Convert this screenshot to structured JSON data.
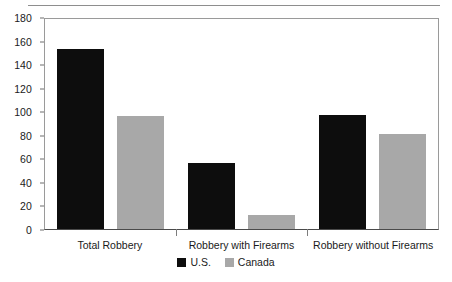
{
  "chart_data": {
    "type": "bar",
    "title": "",
    "xlabel": "",
    "ylabel": "",
    "ylim": [
      0,
      180
    ],
    "yticks": [
      0,
      20,
      40,
      60,
      80,
      100,
      120,
      140,
      160,
      180
    ],
    "grid": false,
    "legend_position": "bottom-center",
    "categories": [
      "Total Robbery",
      "Robbery with Firearms",
      "Robbery without Firearms"
    ],
    "series": [
      {
        "name": "U.S.",
        "color": "#0d0d0d",
        "values": [
          153,
          56,
          97
        ]
      },
      {
        "name": "Canada",
        "color": "#a8a8a8",
        "values": [
          96,
          12,
          81
        ]
      }
    ]
  }
}
